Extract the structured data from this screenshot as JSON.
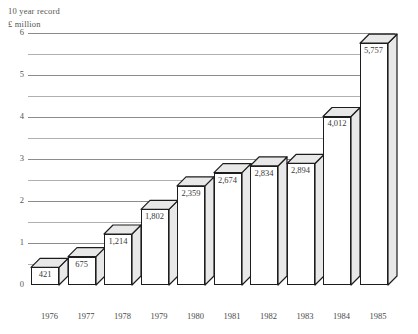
{
  "header": {
    "title": "10 year record",
    "unit": "£ million"
  },
  "chart_data": {
    "type": "bar",
    "title": "10 year record",
    "subtitle": "£ million",
    "xlabel": "",
    "ylabel": "£ million",
    "ylim": [
      0,
      6
    ],
    "ytick_step": 1,
    "minor_tick_step": 0.5,
    "grid": true,
    "legend": false,
    "style": "3d-isometric-bars",
    "unit_scale": "millions",
    "categories": [
      "1976",
      "1977",
      "1978",
      "1979",
      "1980",
      "1981",
      "1982",
      "1983",
      "1984",
      "1985"
    ],
    "values": [
      421,
      675,
      1214,
      1802,
      2359,
      2674,
      2834,
      2894,
      4012,
      5757
    ],
    "value_labels": [
      "421",
      "675",
      "1,214",
      "1,802",
      "2,359",
      "2,674",
      "2,834",
      "2,894",
      "4,012",
      "5,757"
    ],
    "ytick_labels": [
      "0",
      "1",
      "2",
      "3",
      "4",
      "5",
      "6"
    ],
    "colors": {
      "bar_front": "#ffffff",
      "bar_top": "#e8e8e8",
      "bar_side": "#e8e8e8",
      "bar_outline": "#1d1d1d",
      "gridline_major": "#8c8c8c",
      "gridline_minor": "#b0b0b0",
      "text": "#3a3a3a"
    }
  }
}
